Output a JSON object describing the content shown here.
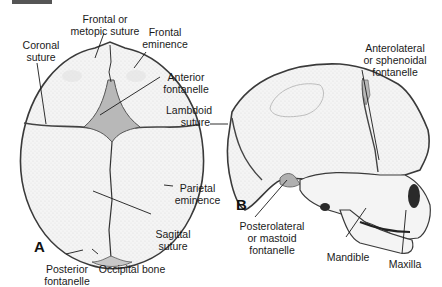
{
  "panels": {
    "a": {
      "letter": "A",
      "labels": {
        "frontal_suture": [
          "Frontal or",
          "metopic suture"
        ],
        "frontal_eminence": [
          "Frontal",
          "eminence"
        ],
        "coronal_suture": [
          "Coronal",
          "suture"
        ],
        "anterior_fontanelle": [
          "Anterior",
          "fontanelle"
        ],
        "parietal_eminence": [
          "Parietal",
          "eminence"
        ],
        "sagittal_suture": [
          "Sagittal",
          "suture"
        ],
        "posterior_fontanelle": [
          "Posterior",
          "fontanelle"
        ],
        "occipital_bone": [
          "Occipital bone"
        ]
      }
    },
    "b": {
      "letter": "B",
      "labels": {
        "lambdoid_suture": [
          "Lambdoid",
          "suture"
        ],
        "anterolateral_fontanelle": [
          "Anterolateral",
          "or sphenoidal",
          "fontanelle"
        ],
        "posterolateral_fontanelle": [
          "Posterolateral",
          "or mastoid",
          "fontanelle"
        ],
        "mandible": [
          "Mandible"
        ],
        "maxilla": [
          "Maxilla"
        ]
      }
    }
  },
  "colors": {
    "bone_fill": "#f2f2f2",
    "outline": "#3a3a3a",
    "fontanelle": "#b8b8b8",
    "leader": "#1a1a1a"
  }
}
